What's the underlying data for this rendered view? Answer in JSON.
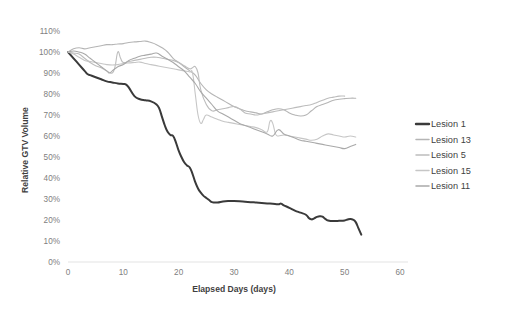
{
  "chart_data": {
    "type": "line",
    "title": "",
    "xlabel": "Elapsed Days (days)",
    "ylabel": "Relative GTV Volume",
    "xlim": [
      0,
      60
    ],
    "ylim": [
      0,
      110
    ],
    "grid": false,
    "legend_position": "right",
    "x_ticks": [
      "0",
      "10",
      "20",
      "30",
      "40",
      "50",
      "60"
    ],
    "x_tick_values": [
      0,
      10,
      20,
      30,
      40,
      50,
      60
    ],
    "y_ticks": [
      "0%",
      "10%",
      "20%",
      "30%",
      "40%",
      "50%",
      "60%",
      "70%",
      "80%",
      "90%",
      "100%",
      "110%"
    ],
    "y_tick_values": [
      0,
      10,
      20,
      30,
      40,
      50,
      60,
      70,
      80,
      90,
      100,
      110
    ],
    "series": [
      {
        "name": "Lesion 1",
        "color": "#3a3a3a",
        "width": 2.0,
        "x": [
          0,
          1,
          2,
          3,
          3.5,
          4,
          5,
          6,
          7,
          8,
          9,
          10,
          10.5,
          11,
          12,
          13,
          14,
          15,
          16,
          16.5,
          17,
          17.5,
          18,
          18.5,
          19,
          19.5,
          20,
          20.5,
          21,
          21.5,
          22,
          22.5,
          23,
          23.5,
          24,
          24.5,
          25,
          25.5,
          26,
          27,
          28,
          29,
          30,
          31,
          32,
          33,
          34,
          35,
          36,
          37,
          38,
          38.5,
          39,
          40,
          41,
          42,
          43,
          43.5,
          44,
          44.5,
          45,
          45.5,
          46,
          46.5,
          47,
          48,
          49,
          50,
          50.5,
          51,
          51.5,
          52,
          52.5,
          53
        ],
        "y": [
          100,
          97,
          94,
          91,
          89.5,
          89,
          88,
          87,
          86,
          85.5,
          85,
          84.8,
          84.5,
          83,
          79,
          77.5,
          77,
          76.5,
          75,
          73,
          69,
          65,
          62,
          60.5,
          60,
          57,
          53,
          50,
          47.5,
          46,
          45,
          42,
          38,
          35,
          33,
          31.5,
          30.5,
          29.5,
          28.5,
          28.3,
          28.8,
          29,
          29,
          28.9,
          28.7,
          28.5,
          28.3,
          28.1,
          27.9,
          27.7,
          27.5,
          27.8,
          27,
          25.8,
          24.5,
          23.5,
          22.5,
          21,
          20.3,
          20.8,
          21.5,
          21.8,
          21.6,
          20.5,
          19.8,
          19.5,
          19.6,
          19.8,
          20.2,
          20.5,
          20.2,
          19,
          16,
          13
        ]
      },
      {
        "name": "Lesion 13",
        "color": "#b5b5b5",
        "width": 1.1,
        "x": [
          0,
          1,
          2,
          3,
          4,
          5,
          6,
          7,
          8,
          9,
          10,
          11,
          12,
          13,
          14,
          15,
          16,
          17,
          18,
          19,
          20,
          21,
          22,
          23,
          24,
          25,
          26,
          27,
          28,
          29,
          30,
          31,
          32,
          33,
          34,
          35,
          36,
          37,
          38,
          39,
          40,
          41,
          42,
          43,
          44,
          45,
          46,
          47,
          48,
          49,
          50,
          51,
          52
        ],
        "y": [
          100,
          101.5,
          102,
          101.5,
          102,
          102.5,
          103,
          103.5,
          103.5,
          103.8,
          104,
          104.5,
          104.8,
          105,
          105.2,
          104.5,
          103.5,
          102,
          100,
          97,
          95,
          93,
          91,
          89,
          85,
          82,
          80,
          78.5,
          77,
          75.5,
          74,
          73,
          72,
          71.5,
          71,
          70.5,
          71.5,
          72.5,
          73,
          72.5,
          71,
          70,
          69.5,
          70,
          72,
          74,
          75,
          76,
          77,
          77.5,
          77.8,
          78,
          78
        ]
      },
      {
        "name": "Lesion 5",
        "color": "#bdbdbd",
        "width": 1.1,
        "x": [
          0,
          1,
          2,
          3,
          4,
          5,
          6,
          7,
          8,
          8.5,
          9,
          9.5,
          10,
          11,
          12,
          13,
          14,
          15,
          16,
          17,
          18,
          19,
          20,
          21,
          22,
          22.5,
          23,
          23.5,
          24,
          25,
          26,
          27,
          28,
          29,
          30,
          31,
          32,
          33,
          34,
          35,
          36,
          37,
          38,
          39,
          40,
          41,
          42,
          43,
          44,
          45,
          46,
          47,
          48,
          49,
          50
        ],
        "y": [
          100,
          99.5,
          99,
          97,
          95,
          93.5,
          92.5,
          91,
          90,
          93,
          100,
          97,
          95,
          95.5,
          96,
          96.5,
          97,
          97.5,
          97.5,
          97,
          96.5,
          96,
          95,
          93.5,
          92,
          92.5,
          93,
          90,
          82,
          75,
          72,
          72.5,
          73,
          73.5,
          74,
          73,
          71,
          70.5,
          70,
          70.5,
          71,
          71.5,
          72,
          72.5,
          73,
          73.5,
          74,
          74.5,
          75,
          76,
          77,
          78,
          78.5,
          79,
          79
        ]
      },
      {
        "name": "Lesion 15",
        "color": "#c6c6c6",
        "width": 1.1,
        "x": [
          0,
          1,
          2,
          3,
          4,
          5,
          6,
          7,
          8,
          9,
          10,
          11,
          12,
          13,
          14,
          15,
          16,
          17,
          18,
          19,
          20,
          21,
          22,
          22.5,
          23,
          23.5,
          24,
          24.5,
          25,
          26,
          27,
          28,
          29,
          30,
          31,
          32,
          33,
          34,
          35,
          36,
          36.5,
          37,
          37.5,
          38,
          39,
          40,
          41,
          42,
          43,
          44,
          45,
          46,
          47,
          48,
          49,
          50,
          51,
          52
        ],
        "y": [
          100,
          99,
          97.5,
          96,
          95.5,
          95,
          94.5,
          94,
          93.8,
          94,
          94.5,
          94.8,
          95,
          95.2,
          94.5,
          94,
          93.5,
          93,
          92.5,
          92,
          91.5,
          91,
          90.5,
          90,
          80,
          70,
          66,
          68,
          70,
          69,
          68,
          67,
          66.5,
          66,
          65.5,
          65,
          64.5,
          64,
          63,
          62,
          67,
          66,
          61,
          60,
          60.5,
          60,
          59.5,
          59,
          58.5,
          58,
          58.5,
          60,
          61,
          60.5,
          60,
          59.5,
          60,
          59.5
        ]
      },
      {
        "name": "Lesion 11",
        "color": "#a9a9a9",
        "width": 1.1,
        "x": [
          0,
          1,
          2,
          3,
          4,
          5,
          6,
          7,
          7.5,
          8,
          9,
          10,
          11,
          12,
          13,
          14,
          15,
          16,
          17,
          18,
          19,
          20,
          21,
          22,
          23,
          24,
          25,
          26,
          27,
          28,
          29,
          30,
          31,
          32,
          33,
          34,
          35,
          36,
          37,
          38,
          39,
          40,
          41,
          42,
          43,
          44,
          45,
          46,
          47,
          48,
          49,
          50,
          51,
          52
        ],
        "y": [
          100,
          100.5,
          100,
          99,
          97,
          95,
          93,
          91,
          90,
          91,
          93,
          94,
          96,
          97,
          98,
          98.5,
          99,
          99.5,
          98,
          96.5,
          95,
          93,
          91,
          88,
          85,
          81,
          78,
          75,
          72,
          70.5,
          69,
          67.5,
          66,
          65,
          64,
          63,
          62,
          61,
          60,
          63,
          61,
          60,
          59,
          58,
          57.5,
          57,
          56.5,
          56,
          55.5,
          55,
          54.5,
          54,
          55,
          56
        ]
      }
    ]
  },
  "legend": {
    "items": [
      {
        "label": "Lesion 1"
      },
      {
        "label": "Lesion 13"
      },
      {
        "label": "Lesion 5"
      },
      {
        "label": "Lesion 15"
      },
      {
        "label": "Lesion 11"
      }
    ]
  }
}
